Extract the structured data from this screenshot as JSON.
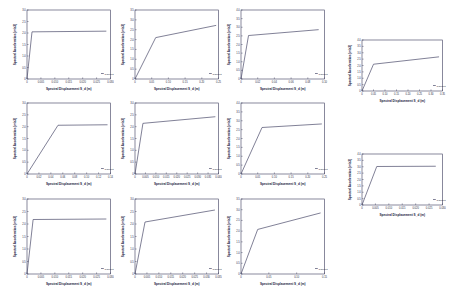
{
  "figure": {
    "background": "#ffffff",
    "curve_color": "#4a4a6a",
    "axis_color": "#3a3a5a",
    "layout": "3x3 grid of capacity curves plus a right-hand column of 2 capacity curves",
    "common_xlabel": "Spectral Displacement S_d (m)",
    "common_ylabel": "Spectral Acceleration (m/s2)"
  },
  "chart_data": [
    {
      "id": "panel-r1c1",
      "type": "line",
      "title": "",
      "xlabel": "Spectral Displacement S_d (m)",
      "ylabel": "Spectral Acceleration (m/s2)",
      "xlim": [
        0,
        0.03
      ],
      "ylim": [
        0,
        3.0
      ],
      "xticks": [
        "0",
        "0.005",
        "0.010",
        "0.015",
        "0.020",
        "0.025",
        "0.030"
      ],
      "yticks": [
        "0",
        "0.5",
        "1.0",
        "1.5",
        "2.0",
        "2.5",
        "3.0"
      ],
      "grid": false,
      "legend": [
        "Capacity"
      ],
      "legend_position": "lower right",
      "x": [
        0.0,
        0.0018,
        0.0285
      ],
      "y": [
        0.0,
        2.05,
        2.08
      ]
    },
    {
      "id": "panel-r1c2",
      "type": "line",
      "title": "",
      "xlabel": "Spectral Displacement S_d (m)",
      "ylabel": "Spectral Acceleration (m/s2)",
      "xlim": [
        0,
        0.25
      ],
      "ylim": [
        0,
        3.5
      ],
      "xticks": [
        "0",
        "0.05",
        "0.10",
        "0.15",
        "0.20",
        "0.25"
      ],
      "yticks": [
        "0",
        "0.5",
        "1.0",
        "1.5",
        "2.0",
        "2.5",
        "3.0",
        "3.5"
      ],
      "grid": false,
      "legend": [
        "Capacity"
      ],
      "legend_position": "lower right",
      "x": [
        0.0,
        0.062,
        0.243
      ],
      "y": [
        0.0,
        2.1,
        2.72
      ]
    },
    {
      "id": "panel-r1c3",
      "type": "line",
      "title": "",
      "xlabel": "Spectral Displacement S_d (m)",
      "ylabel": "Spectral Acceleration (m/s2)",
      "xlim": [
        0,
        0.1
      ],
      "ylim": [
        0,
        4.0
      ],
      "xticks": [
        "0",
        "0.02",
        "0.04",
        "0.06",
        "0.08",
        "0.10"
      ],
      "yticks": [
        "0",
        "0.5",
        "1.0",
        "1.5",
        "2.0",
        "2.5",
        "3.0",
        "3.5",
        "4.0"
      ],
      "grid": false,
      "legend": [
        "Capacity"
      ],
      "legend_position": "lower right",
      "x": [
        0.0,
        0.009,
        0.093
      ],
      "y": [
        0.0,
        2.52,
        2.86
      ]
    },
    {
      "id": "panel-r2c1",
      "type": "line",
      "title": "",
      "xlabel": "Spectral Displacement S_d (m)",
      "ylabel": "Spectral Acceleration (m/s2)",
      "xlim": [
        0,
        0.14
      ],
      "ylim": [
        0,
        3.0
      ],
      "xticks": [
        "0",
        "0.02",
        "0.04",
        "0.06",
        "0.08",
        "0.10",
        "0.12",
        "0.14"
      ],
      "yticks": [
        "0",
        "0.5",
        "1.0",
        "1.5",
        "2.0",
        "2.5",
        "3.0"
      ],
      "grid": false,
      "legend": [
        "Capacity"
      ],
      "legend_position": "lower right",
      "x": [
        0.0,
        0.052,
        0.135
      ],
      "y": [
        0.0,
        2.06,
        2.08
      ]
    },
    {
      "id": "panel-r2c2",
      "type": "line",
      "title": "",
      "xlabel": "Spectral Displacement S_d (m)",
      "ylabel": "Spectral Acceleration (m/s2)",
      "xlim": [
        0,
        0.04
      ],
      "ylim": [
        0,
        3.0
      ],
      "xticks": [
        "0",
        "0.005",
        "0.010",
        "0.015",
        "0.020",
        "0.025",
        "0.030",
        "0.035",
        "0.040"
      ],
      "yticks": [
        "0",
        "0.5",
        "1.0",
        "1.5",
        "2.0",
        "2.5",
        "3.0"
      ],
      "grid": false,
      "legend": [
        "Capacity"
      ],
      "legend_position": "lower right",
      "x": [
        0.0,
        0.0038,
        0.0385
      ],
      "y": [
        0.0,
        2.14,
        2.42
      ]
    },
    {
      "id": "panel-r2c3",
      "type": "line",
      "title": "",
      "xlabel": "Spectral Displacement S_d (m)",
      "ylabel": "Spectral Acceleration (m/s2)",
      "xlim": [
        0,
        0.25
      ],
      "ylim": [
        0,
        4.0
      ],
      "xticks": [
        "0",
        "0.05",
        "0.10",
        "0.15",
        "0.20",
        "0.25"
      ],
      "yticks": [
        "0",
        "0.5",
        "1.0",
        "1.5",
        "2.0",
        "2.5",
        "3.0",
        "3.5",
        "4.0"
      ],
      "grid": false,
      "legend": [
        "Capacity"
      ],
      "legend_position": "lower right",
      "x": [
        0.0,
        0.063,
        0.242
      ],
      "y": [
        0.0,
        2.62,
        2.82
      ]
    },
    {
      "id": "panel-r3c1",
      "type": "line",
      "title": "",
      "xlabel": "Spectral Displacement S_d (m)",
      "ylabel": "Spectral Acceleration (m/s2)",
      "xlim": [
        0,
        0.03
      ],
      "ylim": [
        0,
        3.0
      ],
      "xticks": [
        "0",
        "0.005",
        "0.010",
        "0.015",
        "0.020",
        "0.025",
        "0.030"
      ],
      "yticks": [
        "0",
        "0.5",
        "1.0",
        "1.5",
        "2.0",
        "2.5",
        "3.0"
      ],
      "grid": false,
      "legend": [
        "Capacity"
      ],
      "legend_position": "lower right",
      "x": [
        0.0,
        0.0022,
        0.0285
      ],
      "y": [
        0.0,
        2.18,
        2.2
      ]
    },
    {
      "id": "panel-r3c2",
      "type": "line",
      "title": "",
      "xlabel": "Spectral Displacement S_d (m)",
      "ylabel": "Spectral Acceleration (m/s2)",
      "xlim": [
        0,
        0.035
      ],
      "ylim": [
        0,
        3.0
      ],
      "xticks": [
        "0",
        "0.005",
        "0.010",
        "0.015",
        "0.020",
        "0.025",
        "0.030",
        "0.035"
      ],
      "yticks": [
        "0",
        "0.5",
        "1.0",
        "1.5",
        "2.0",
        "2.5",
        "3.0"
      ],
      "grid": false,
      "legend": [
        "Capacity"
      ],
      "legend_position": "lower right",
      "x": [
        0.0,
        0.0042,
        0.0335
      ],
      "y": [
        0.0,
        2.08,
        2.56
      ]
    },
    {
      "id": "panel-r3c3",
      "type": "line",
      "title": "",
      "xlabel": "Spectral Displacement S_d (m)",
      "ylabel": "Spectral Acceleration (m/s2)",
      "xlim": [
        0,
        0.15
      ],
      "ylim": [
        0,
        3.5
      ],
      "xticks": [
        "0",
        "0.05",
        "0.10",
        "0.15"
      ],
      "yticks": [
        "0",
        "0.5",
        "1.0",
        "1.5",
        "2.0",
        "2.5",
        "3.0",
        "3.5"
      ],
      "grid": false,
      "legend": [
        "Capacity"
      ],
      "legend_position": "lower right",
      "x": [
        0.0,
        0.03,
        0.143
      ],
      "y": [
        0.0,
        2.08,
        2.85
      ]
    },
    {
      "id": "panel-rcol1",
      "type": "line",
      "title": "",
      "xlabel": "Spectral Displacement S_d (m)",
      "ylabel": "Spectral Acceleration (m/s2)",
      "xlim": [
        0,
        0.35
      ],
      "ylim": [
        0,
        4.0
      ],
      "xticks": [
        "0",
        "0.05",
        "0.10",
        "0.15",
        "0.20",
        "0.25",
        "0.30",
        "0.35"
      ],
      "yticks": [
        "0",
        "0.5",
        "1.0",
        "1.5",
        "2.0",
        "2.5",
        "3.0",
        "3.5",
        "4.0"
      ],
      "grid": false,
      "legend": [
        "Capacity"
      ],
      "legend_position": "lower right",
      "x": [
        0.0,
        0.05,
        0.335
      ],
      "y": [
        0.0,
        2.1,
        2.68
      ]
    },
    {
      "id": "panel-rcol2",
      "type": "line",
      "title": "",
      "xlabel": "Spectral Displacement S_d (m)",
      "ylabel": "Spectral Acceleration (m/s2)",
      "xlim": [
        0,
        0.03
      ],
      "ylim": [
        0,
        4.0
      ],
      "xticks": [
        "0",
        "0.005",
        "0.010",
        "0.015",
        "0.020",
        "0.025",
        "0.030"
      ],
      "yticks": [
        "0",
        "0.5",
        "1.0",
        "1.5",
        "2.0",
        "2.5",
        "3.0",
        "3.5",
        "4.0"
      ],
      "grid": false,
      "legend": [
        "Capacity"
      ],
      "legend_position": "lower right",
      "x": [
        0.0,
        0.0055,
        0.0275
      ],
      "y": [
        0.0,
        3.02,
        3.04
      ]
    }
  ]
}
